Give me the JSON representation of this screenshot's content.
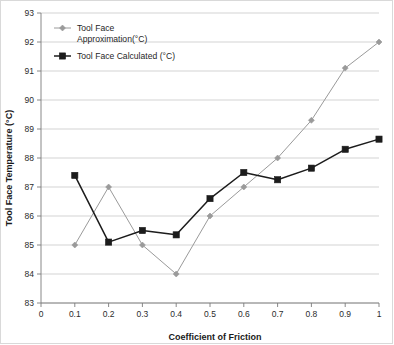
{
  "chart_data": {
    "type": "line",
    "title": "",
    "subtitle": "",
    "xlabel": "Coefficient of Friction",
    "ylabel": "Tool Face Temperature (°C)",
    "xlim": [
      0,
      1
    ],
    "ylim": [
      83,
      93
    ],
    "xticks": [
      "0",
      "0.1",
      "0.2",
      "0.3",
      "0.4",
      "0.5",
      "0.6",
      "0.7",
      "0.8",
      "0.9",
      "1"
    ],
    "yticks": [
      "83",
      "84",
      "85",
      "86",
      "87",
      "88",
      "89",
      "90",
      "91",
      "92",
      "93"
    ],
    "grid": "horizontal",
    "legend_position": "top-left-inside",
    "x": [
      0.1,
      0.2,
      0.3,
      0.4,
      0.5,
      0.6,
      0.7,
      0.8,
      0.9,
      1.0
    ],
    "series": [
      {
        "name": "Tool Face Approximation(°C)",
        "color": "#9a9a9a",
        "marker": "diamond",
        "values": [
          85.0,
          87.0,
          85.0,
          84.0,
          86.0,
          87.0,
          88.0,
          89.3,
          91.1,
          92.0
        ]
      },
      {
        "name": "Tool Face Calculated (°C)",
        "color": "#1c1c1c",
        "marker": "square",
        "values": [
          87.4,
          85.1,
          85.5,
          85.35,
          86.6,
          87.5,
          87.25,
          87.65,
          88.3,
          88.65
        ]
      }
    ]
  },
  "legend": {
    "entries": [
      {
        "label_line1": "Tool Face",
        "label_line2": "Approximation(°C)",
        "color": "#9a9a9a"
      },
      {
        "label_line1": "Tool Face Calculated (°C)",
        "label_line2": "",
        "color": "#1c1c1c"
      }
    ]
  },
  "axes": {
    "x_title": "Coefficient of Friction",
    "y_title": "Tool Face Temperature (°C)"
  }
}
